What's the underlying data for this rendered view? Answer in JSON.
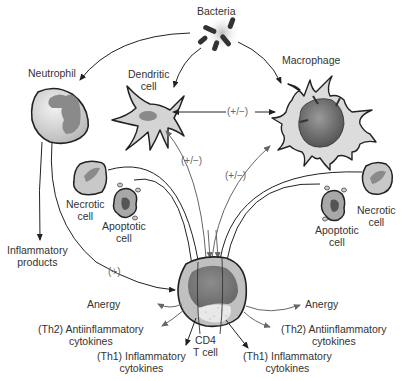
{
  "labels": {
    "bacteria": "Bacteria",
    "neutrophil": "Neutrophil",
    "dendritic": "Dendritic\ncell",
    "macrophage": "Macrophage",
    "necrotic_left": "Necrotic\ncell",
    "apoptotic_left": "Apoptotic\ncell",
    "necrotic_right": "Necrotic\ncell",
    "apoptotic_right": "Apoptotic\ncell",
    "inflammatory_products": "Inflammatory\nproducts",
    "cd4": "CD4\nT cell",
    "anergy_left": "Anergy",
    "th2_left": "(Th2) Antiinflammatory\ncytokines",
    "th1_left": "(Th1) Inflammatory\ncytokines",
    "anergy_right": "Anergy",
    "th2_right": "(Th2) Antiinflammatory\ncytokines",
    "th1_right": "(Th1) Inflammatory\ncytokines"
  },
  "signs": {
    "dc_macro": "(+/−)",
    "tcell_dc": "(+/−)",
    "tcell_macro": "(+/−)",
    "neutro_tcell": "(+)"
  },
  "colors": {
    "stroke": "#222222",
    "cell_fill": "#d4d4d4",
    "nucleus_fill": "#8a8a8a",
    "arrow_gray": "#555555"
  }
}
